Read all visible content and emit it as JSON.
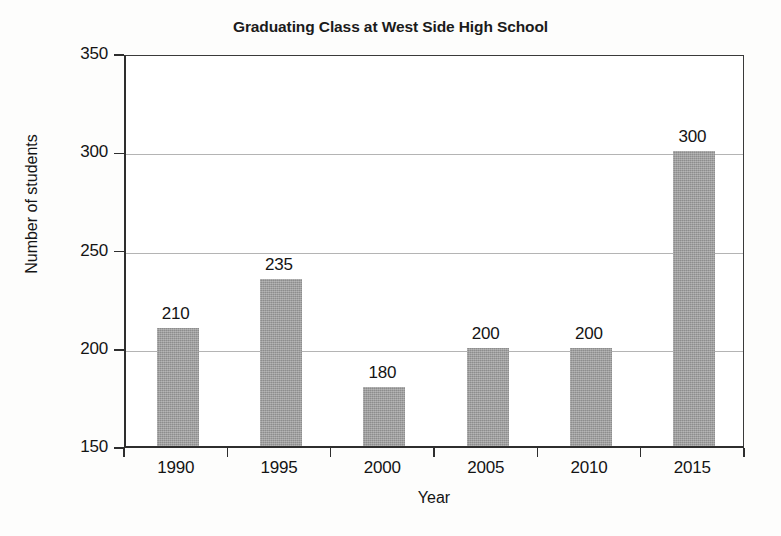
{
  "chart_data": {
    "type": "bar",
    "title": "Graduating Class at West Side High School",
    "xlabel": "Year",
    "ylabel": "Number of students",
    "categories": [
      "1990",
      "1995",
      "2000",
      "2005",
      "2010",
      "2015"
    ],
    "values": [
      210,
      235,
      180,
      200,
      200,
      300
    ],
    "data_labels": [
      "210",
      "235",
      "180",
      "200",
      "200",
      "300"
    ],
    "ylim": [
      150,
      350
    ],
    "yticks": [
      150,
      200,
      250,
      300,
      350
    ],
    "ytick_labels": [
      "150",
      "200",
      "250",
      "300",
      "350"
    ],
    "grid": true,
    "grid_axis": "y",
    "legend": null,
    "bar_color": "#9b9b9b",
    "axis_color": "#2e2e2e",
    "grid_color": "#b4b4b4",
    "background": "#ffffff"
  }
}
